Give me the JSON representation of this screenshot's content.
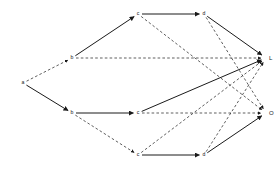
{
  "diagram": {
    "width": 278,
    "height": 170,
    "background_color": "#ffffff",
    "edge_color": "#1a1a1a",
    "label_color": "#1a1a1a",
    "nodes": [
      {
        "id": "a",
        "label": "a",
        "x": 23,
        "y": 83,
        "kind": "source"
      },
      {
        "id": "b1",
        "label": "b",
        "x": 72,
        "y": 58,
        "kind": "intermediate"
      },
      {
        "id": "b2",
        "label": "b",
        "x": 72,
        "y": 113,
        "kind": "intermediate"
      },
      {
        "id": "c1",
        "label": "c",
        "x": 138,
        "y": 14,
        "kind": "intermediate"
      },
      {
        "id": "c2",
        "label": "c",
        "x": 138,
        "y": 113,
        "kind": "intermediate"
      },
      {
        "id": "c3",
        "label": "c",
        "x": 138,
        "y": 155,
        "kind": "intermediate"
      },
      {
        "id": "d1",
        "label": "d",
        "x": 204,
        "y": 14,
        "kind": "intermediate"
      },
      {
        "id": "d2",
        "label": "d",
        "x": 204,
        "y": 155,
        "kind": "intermediate"
      },
      {
        "id": "L",
        "label": "L",
        "x": 266,
        "y": 58,
        "kind": "terminal"
      },
      {
        "id": "O",
        "label": "O",
        "x": 266,
        "y": 113,
        "kind": "terminal"
      }
    ],
    "edges": [
      {
        "from": "a",
        "to": "b1",
        "style": "dashed",
        "arrow": true
      },
      {
        "from": "a",
        "to": "b2",
        "style": "solid",
        "arrow": true
      },
      {
        "from": "b1",
        "to": "c1",
        "style": "solid",
        "arrow": true
      },
      {
        "from": "b1",
        "to": "L",
        "style": "dashed",
        "arrow": true
      },
      {
        "from": "c1",
        "to": "d1",
        "style": "solid",
        "arrow": true
      },
      {
        "from": "c1",
        "to": "O",
        "style": "dashed",
        "arrow": true
      },
      {
        "from": "d1",
        "to": "L",
        "style": "solid",
        "arrow": true
      },
      {
        "from": "d1",
        "to": "O",
        "style": "dashed",
        "arrow": true
      },
      {
        "from": "b2",
        "to": "c2",
        "style": "solid",
        "arrow": true
      },
      {
        "from": "b2",
        "to": "c3",
        "style": "dashed",
        "arrow": true
      },
      {
        "from": "c2",
        "to": "L",
        "style": "solid",
        "arrow": true
      },
      {
        "from": "c2",
        "to": "O",
        "style": "dashed",
        "arrow": true
      },
      {
        "from": "c3",
        "to": "d2",
        "style": "solid",
        "arrow": true
      },
      {
        "from": "c3",
        "to": "L",
        "style": "dashed",
        "arrow": true
      },
      {
        "from": "d2",
        "to": "O",
        "style": "solid",
        "arrow": true
      },
      {
        "from": "d2",
        "to": "L",
        "style": "dashed",
        "arrow": true
      }
    ]
  }
}
